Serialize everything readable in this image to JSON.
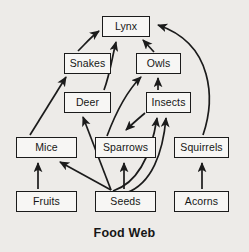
{
  "diagram": {
    "title": "Food Web",
    "type": "food-web-directed-graph",
    "background_color": "#edebe8",
    "box_fill_color": "#f7f6f4",
    "box_border_color": "#1b1b1b",
    "text_color": "#161616",
    "arrow_color": "#1b1b1b",
    "nodes": [
      {
        "id": "lynx",
        "label": "Lynx",
        "x": 102,
        "y": 16,
        "w": 48,
        "h": 21
      },
      {
        "id": "snakes",
        "label": "Snakes",
        "x": 64,
        "y": 53,
        "w": 47,
        "h": 21
      },
      {
        "id": "owls",
        "label": "Owls",
        "x": 136,
        "y": 53,
        "w": 45,
        "h": 21
      },
      {
        "id": "deer",
        "label": "Deer",
        "x": 64,
        "y": 92,
        "w": 47,
        "h": 21
      },
      {
        "id": "insects",
        "label": "Insects",
        "x": 146,
        "y": 92,
        "w": 45,
        "h": 21
      },
      {
        "id": "mice",
        "label": "Mice",
        "x": 16,
        "y": 137,
        "w": 61,
        "h": 21
      },
      {
        "id": "sparrows",
        "label": "Sparrows",
        "x": 95,
        "y": 137,
        "w": 61,
        "h": 21
      },
      {
        "id": "squirrels",
        "label": "Squirrels",
        "x": 174,
        "y": 137,
        "w": 55,
        "h": 21
      },
      {
        "id": "fruits",
        "label": "Fruits",
        "x": 16,
        "y": 191,
        "w": 61,
        "h": 21
      },
      {
        "id": "seeds",
        "label": "Seeds",
        "x": 95,
        "y": 191,
        "w": 61,
        "h": 21
      },
      {
        "id": "acorns",
        "label": "Acorns",
        "x": 174,
        "y": 191,
        "w": 55,
        "h": 21
      }
    ],
    "edges": [
      {
        "from": "snakes",
        "to": "lynx",
        "style": "curved"
      },
      {
        "from": "deer",
        "to": "lynx",
        "style": "curved"
      },
      {
        "from": "owls",
        "to": "lynx",
        "style": "straight"
      },
      {
        "from": "squirrels",
        "to": "lynx",
        "style": "long-curve"
      },
      {
        "from": "mice",
        "to": "snakes",
        "style": "straight"
      },
      {
        "from": "sparrows",
        "to": "owls",
        "style": "curved"
      },
      {
        "from": "insects",
        "to": "owls",
        "style": "straight"
      },
      {
        "from": "insects",
        "to": "sparrows",
        "style": "curved"
      },
      {
        "from": "seeds",
        "to": "deer",
        "style": "straight"
      },
      {
        "from": "seeds",
        "to": "mice",
        "style": "straight"
      },
      {
        "from": "seeds",
        "to": "sparrows",
        "style": "straight"
      },
      {
        "from": "seeds",
        "to": "insects",
        "style": "curved"
      },
      {
        "from": "seeds",
        "to": "insects2",
        "style": "curved"
      },
      {
        "from": "fruits",
        "to": "mice",
        "style": "straight"
      },
      {
        "from": "acorns",
        "to": "squirrels",
        "style": "straight"
      }
    ],
    "title_position": {
      "x": 0,
      "y": 226
    }
  }
}
